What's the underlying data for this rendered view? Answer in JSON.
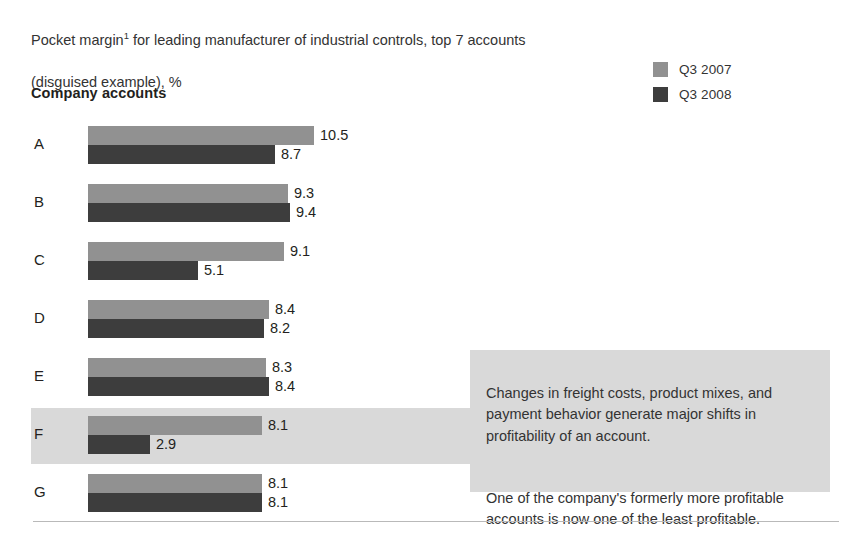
{
  "title": {
    "line1": "Pocket margin",
    "superscript": "1",
    "line1_rest": " for leading manufacturer of industrial controls, top 7 accounts",
    "line2": "(disguised example), %"
  },
  "axis_header": "Company accounts",
  "legend": [
    {
      "label": "Q3 2007",
      "color": "#919191",
      "icon": "legend-swatch-light"
    },
    {
      "label": "Q3 2008",
      "color": "#3d3d3d",
      "icon": "legend-swatch-dark"
    }
  ],
  "callout": {
    "paragraph1": "Changes in freight costs, product mixes, and payment behavior generate major shifts in profitability of an account.",
    "paragraph2": "One of the company's formerly more profitable accounts is now one of the least profitable."
  },
  "rows": [
    {
      "label": "A",
      "q3_2007": "10.5",
      "q3_2008": "8.7",
      "highlighted": false
    },
    {
      "label": "B",
      "q3_2007": "9.3",
      "q3_2008": "9.4",
      "highlighted": false
    },
    {
      "label": "C",
      "q3_2007": "9.1",
      "q3_2008": "5.1",
      "highlighted": false
    },
    {
      "label": "D",
      "q3_2007": "8.4",
      "q3_2008": "8.2",
      "highlighted": false
    },
    {
      "label": "E",
      "q3_2007": "8.3",
      "q3_2008": "8.4",
      "highlighted": false
    },
    {
      "label": "F",
      "q3_2007": "8.1",
      "q3_2008": "2.9",
      "highlighted": true
    },
    {
      "label": "G",
      "q3_2007": "8.1",
      "q3_2008": "8.1",
      "highlighted": false
    }
  ],
  "colors": {
    "q3_2007": "#919191",
    "q3_2008": "#3d3d3d",
    "highlight_band": "#d9d9d9",
    "callout_bg": "#d9d9d9",
    "text": "#231f20",
    "divider": "#b9b9b9"
  },
  "chart_data": {
    "type": "bar",
    "orientation": "horizontal",
    "title": "Pocket margin1 for leading manufacturer of industrial controls, top 7 accounts (disguised example), %",
    "xlabel": "",
    "ylabel": "Company accounts",
    "categories": [
      "A",
      "B",
      "C",
      "D",
      "E",
      "F",
      "G"
    ],
    "series": [
      {
        "name": "Q3 2007",
        "color": "#919191",
        "values": [
          10.5,
          9.3,
          9.1,
          8.4,
          8.3,
          8.1,
          8.1
        ]
      },
      {
        "name": "Q3 2008",
        "color": "#3d3d3d",
        "values": [
          8.7,
          9.4,
          5.1,
          8.2,
          8.4,
          2.9,
          8.1
        ]
      }
    ],
    "xlim": [
      0,
      10.5
    ],
    "grid": false,
    "legend_position": "top-right",
    "data_labels": true,
    "units": "%",
    "highlighted_category": "F",
    "annotations": [
      "Changes in freight costs, product mixes, and payment behavior generate major shifts in profitability of an account.",
      "One of the company's formerly more profitable accounts is now one of the least profitable."
    ]
  },
  "scale": {
    "px_per_unit": 21.5,
    "bar_origin_x": 88
  }
}
